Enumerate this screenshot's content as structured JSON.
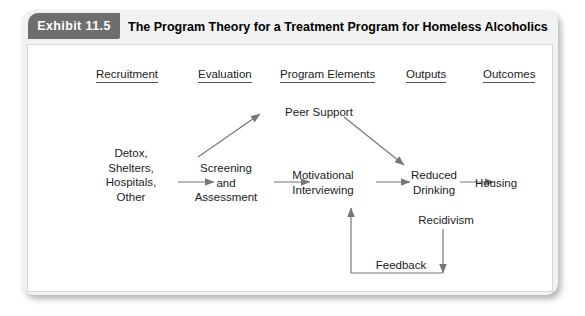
{
  "exhibit": {
    "badge_label": "Exhibit 11.5",
    "title": "The Program Theory for a Treatment Program for Homeless Alcoholics"
  },
  "colors": {
    "badge_bg": "#6e6e6e",
    "frame_bg": "#f2f2f2",
    "panel_bg": "#ffffff",
    "text": "#1c1c1c",
    "arrow": "#777777"
  },
  "columns": [
    {
      "label": "Recruitment",
      "x": 68,
      "y": 22
    },
    {
      "label": "Evaluation",
      "x": 170,
      "y": 22
    },
    {
      "label": "Program Elements",
      "x": 252,
      "y": 22
    },
    {
      "label": "Outputs",
      "x": 378,
      "y": 22
    },
    {
      "label": "Outcomes",
      "x": 455,
      "y": 22
    }
  ],
  "nodes": [
    {
      "id": "intake",
      "label": "Detox,\nShelters,\nHospitals,\nOther",
      "x": 60,
      "y": 101,
      "w": 86
    },
    {
      "id": "screening",
      "label": "Screening\nand\nAssessment",
      "x": 156,
      "y": 116,
      "w": 84
    },
    {
      "id": "peer-support",
      "label": "Peer Support",
      "x": 248,
      "y": 60,
      "w": 86
    },
    {
      "id": "motivational",
      "label": "Motivational\nInterviewing",
      "x": 252,
      "y": 123,
      "w": 86
    },
    {
      "id": "reduced",
      "label": "Reduced\nDrinking",
      "x": 370,
      "y": 123,
      "w": 72
    },
    {
      "id": "housing",
      "label": "Housing",
      "x": 438,
      "y": 131,
      "w": 60
    },
    {
      "id": "recidivism",
      "label": "Recidivism",
      "x": 383,
      "y": 168,
      "w": 70
    },
    {
      "id": "feedback",
      "label": "Feedback",
      "x": 340,
      "y": 213,
      "w": 66
    }
  ],
  "connections": [
    {
      "from": "intake",
      "to": "screening",
      "type": "straight-right"
    },
    {
      "from": "screening",
      "to": "motivational",
      "type": "straight-right"
    },
    {
      "from": "screening",
      "to": "peer-support",
      "type": "diagonal-up-right"
    },
    {
      "from": "peer-support",
      "to": "reduced",
      "type": "diagonal-down-right"
    },
    {
      "from": "motivational",
      "to": "reduced",
      "type": "straight-right"
    },
    {
      "from": "reduced",
      "to": "housing",
      "type": "straight-right"
    },
    {
      "from": "recidivism",
      "to": "feedback",
      "type": "down-then-left-then-up"
    },
    {
      "from": "feedback",
      "to": "motivational",
      "type": "up-arrow"
    }
  ]
}
